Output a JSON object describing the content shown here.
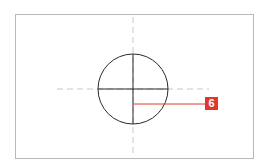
{
  "diagram": {
    "callout_label": "6",
    "colors": {
      "frame": "#b8b8b8",
      "circle": "#2a2a2a",
      "centerline": "#c8c8c8",
      "callout": "#e2382a"
    }
  }
}
